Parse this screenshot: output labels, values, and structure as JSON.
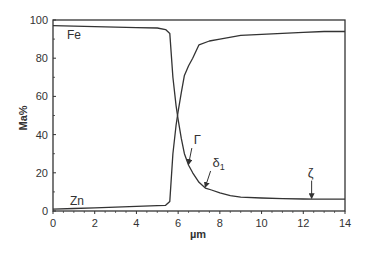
{
  "chart_data": {
    "type": "line",
    "title": "",
    "xlabel": "µm",
    "ylabel": "Ma%",
    "xlim": [
      0,
      14
    ],
    "ylim": [
      0,
      100
    ],
    "xticks": [
      0,
      2,
      4,
      6,
      8,
      10,
      12,
      14
    ],
    "yticks": [
      0,
      20,
      40,
      60,
      80,
      100
    ],
    "grid": false,
    "legend": "none (inline labels)",
    "series": [
      {
        "name": "Fe",
        "x": [
          0,
          1,
          2,
          3,
          4,
          5,
          5.4,
          5.6,
          5.75,
          5.9,
          6.0,
          6.15,
          6.3,
          6.5,
          6.7,
          7.0,
          7.3,
          7.6,
          8.0,
          8.5,
          9.0,
          10,
          11,
          12,
          12.5,
          13,
          14
        ],
        "y": [
          97,
          96.8,
          96.5,
          96.3,
          96,
          95.8,
          95,
          93,
          70,
          55,
          48,
          38,
          30,
          24,
          20,
          15,
          12,
          11,
          9.5,
          8,
          7.2,
          6.8,
          6.5,
          6.3,
          6.2,
          6.2,
          6.2
        ]
      },
      {
        "name": "Zn",
        "x": [
          0,
          1,
          2,
          3,
          4,
          5,
          5.4,
          5.6,
          5.75,
          5.9,
          6.0,
          6.15,
          6.3,
          6.5,
          6.7,
          7.0,
          7.5,
          8.0,
          9.0,
          10,
          11,
          12,
          13,
          14
        ],
        "y": [
          1,
          1.3,
          1.7,
          2,
          2.4,
          2.8,
          3,
          5,
          30,
          45,
          52,
          62,
          71,
          76,
          80,
          87,
          89,
          90,
          92,
          92.5,
          93,
          93.5,
          94,
          94
        ]
      }
    ],
    "annotations": [
      {
        "text": "Fe",
        "x": 0.8,
        "y": 91,
        "type": "series-label"
      },
      {
        "text": "Zn",
        "x": 0.8,
        "y": 5,
        "type": "series-label"
      },
      {
        "text": "Γ",
        "x": 6.5,
        "y": 24,
        "type": "arrow",
        "label_x": 6.8,
        "label_y": 34
      },
      {
        "text": "δ1",
        "x": 7.3,
        "y": 12,
        "type": "arrow",
        "label_x": 7.7,
        "label_y": 22
      },
      {
        "text": "ζ",
        "x": 12.4,
        "y": 6.2,
        "type": "arrow",
        "label_x": 12.4,
        "label_y": 18
      }
    ]
  },
  "axes": {
    "x_label": "µm",
    "y_label": "Ma%",
    "x_tick_labels": [
      "0",
      "2",
      "4",
      "6",
      "8",
      "10",
      "12",
      "14"
    ],
    "y_tick_labels": [
      "0",
      "20",
      "40",
      "60",
      "80",
      "100"
    ]
  },
  "labels": {
    "fe": "Fe",
    "zn": "Zn",
    "gamma": "Γ",
    "delta": "δ",
    "delta_sub": "1",
    "zeta": "ζ"
  },
  "colors": {
    "line": "#333333",
    "axis": "#333333",
    "text": "#333333"
  }
}
